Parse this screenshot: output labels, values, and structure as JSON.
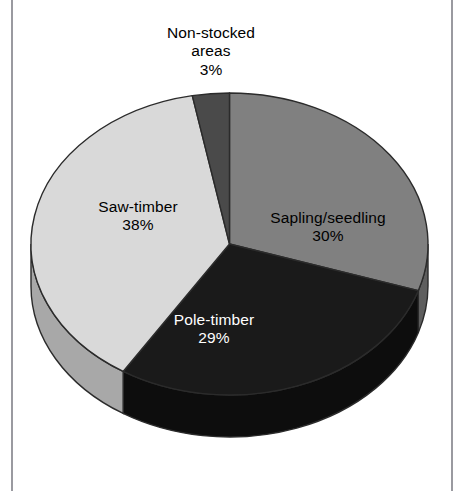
{
  "figure": {
    "background_color": "#ffffff",
    "frame_color": "#9a9aa0"
  },
  "chart_data": {
    "type": "pie",
    "title": "",
    "subtitle": "",
    "xlabel": "",
    "ylabel": "",
    "legend_position": "none",
    "grid": false,
    "three_d": true,
    "start_angle_deg": 0,
    "direction": "clockwise",
    "units": "percent",
    "categories": [
      "Sapling/seedling",
      "Pole-timber",
      "Saw-timber",
      "Non-stocked areas"
    ],
    "values": [
      30,
      29,
      38,
      3
    ],
    "total": 100,
    "colors": [
      "#808080",
      "#1a1a1a",
      "#d9d9d9",
      "#4a4a4a"
    ],
    "side_colors": [
      "#5e5e5e",
      "#0d0d0d",
      "#a8a8a8",
      "#333333"
    ],
    "slices": [
      {
        "name": "Sapling/seedling",
        "value": 30,
        "value_label": "30%",
        "color": "#808080",
        "side_color": "#5e5e5e",
        "label_color": "#000000",
        "start_angle_deg": 0,
        "end_angle_deg": 108
      },
      {
        "name": "Pole-timber",
        "value": 29,
        "value_label": "29%",
        "color": "#1a1a1a",
        "side_color": "#0d0d0d",
        "label_color": "#ffffff",
        "start_angle_deg": 108,
        "end_angle_deg": 212.4
      },
      {
        "name": "Saw-timber",
        "value": 38,
        "value_label": "38%",
        "color": "#d9d9d9",
        "side_color": "#a8a8a8",
        "label_color": "#000000",
        "start_angle_deg": 212.4,
        "end_angle_deg": 349.2
      },
      {
        "name": "Non-stocked areas",
        "value": 3,
        "value_label": "3%",
        "color": "#4a4a4a",
        "side_color": "#333333",
        "label_color": "#000000",
        "start_angle_deg": 349.2,
        "end_angle_deg": 360
      }
    ]
  },
  "labels": {
    "non_stocked": {
      "line1": "Non-stocked",
      "line2": "areas",
      "value": "3%"
    },
    "sapling": {
      "line1": "Sapling/seedling",
      "value": "30%"
    },
    "saw_timber": {
      "line1": "Saw-timber",
      "value": "38%"
    },
    "pole_timber": {
      "line1": "Pole-timber",
      "value": "29%"
    }
  }
}
